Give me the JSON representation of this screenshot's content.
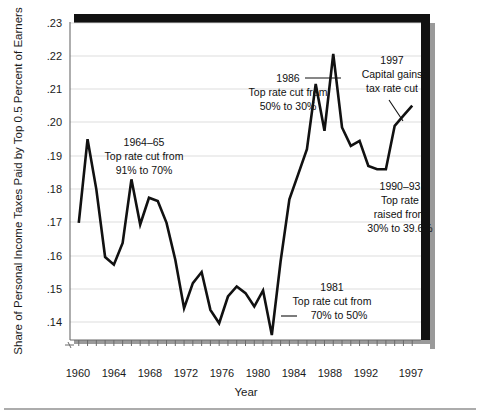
{
  "chart_data": {
    "type": "line",
    "title": "",
    "xlabel": "Year",
    "ylabel": "Share of Personal Income Taxes Paid by Top 0.5 Percent of Earners",
    "xlim": [
      1958,
      1998
    ],
    "ylim": [
      0.135,
      0.23
    ],
    "grid": true,
    "legend": "none",
    "ytick_labels": [
      ".23",
      ".22",
      ".21",
      ".20",
      ".19",
      ".18",
      ".17",
      ".16",
      ".15",
      ".14"
    ],
    "ytick_values": [
      0.23,
      0.22,
      0.21,
      0.2,
      0.19,
      0.18,
      0.17,
      0.16,
      0.15,
      0.14
    ],
    "xtick_labels": [
      "1960",
      "1964",
      "1968",
      "1972",
      "1976",
      "1980",
      "1984",
      "1988",
      "1992",
      "1997"
    ],
    "xtick_values": [
      1960,
      1964,
      1968,
      1972,
      1976,
      1980,
      1984,
      1988,
      1992,
      1997
    ],
    "series": [
      {
        "name": "Share of personal income taxes paid by top 0.5% of earners",
        "x": [
          1959,
          1960,
          1961,
          1962,
          1963,
          1964,
          1965,
          1966,
          1967,
          1968,
          1969,
          1970,
          1971,
          1972,
          1973,
          1974,
          1975,
          1976,
          1977,
          1978,
          1979,
          1980,
          1981,
          1982,
          1983,
          1984,
          1985,
          1986,
          1987,
          1988,
          1989,
          1990,
          1991,
          1992,
          1993,
          1994,
          1995,
          1996,
          1997
        ],
        "values": [
          0.17,
          0.195,
          0.18,
          0.1598,
          0.1575,
          0.164,
          0.183,
          0.1695,
          0.1775,
          0.1765,
          0.17,
          0.159,
          0.1445,
          0.152,
          0.1553,
          0.144,
          0.14,
          0.148,
          0.151,
          0.149,
          0.145,
          0.1498,
          0.1365,
          0.1585,
          0.177,
          0.1845,
          0.192,
          0.2115,
          0.1975,
          0.2205,
          0.1985,
          0.193,
          0.1945,
          0.187,
          0.186,
          0.186,
          0.199,
          0.202,
          0.205
        ]
      }
    ],
    "annotations": [
      {
        "id": "annot-1964-65",
        "lines": [
          "1964–65",
          "Top rate cut from",
          "91% to 70%"
        ],
        "align": "center"
      },
      {
        "id": "annot-1986",
        "lines": [
          "1986",
          "Top rate cut from",
          "50% to 30%"
        ],
        "align": "center",
        "has_leader": true
      },
      {
        "id": "annot-1997",
        "lines": [
          "1997",
          "Capital gains",
          "tax rate cut"
        ],
        "align": "center",
        "has_leader": true
      },
      {
        "id": "annot-1990-93",
        "lines": [
          "1990–93",
          "Top rate",
          "raised from",
          "30% to 39.6%"
        ],
        "align": "center"
      },
      {
        "id": "annot-1981",
        "lines": [
          "1981",
          "Top rate cut from",
          "70% to 50%"
        ],
        "align": "center",
        "has_leader": true
      }
    ]
  },
  "colors": {
    "line": "#111111",
    "grid": "#d9d9d9",
    "axis": "#6b6b6b",
    "text": "#1a1a1a",
    "shadow": "#111111",
    "background": "#ffffff"
  }
}
